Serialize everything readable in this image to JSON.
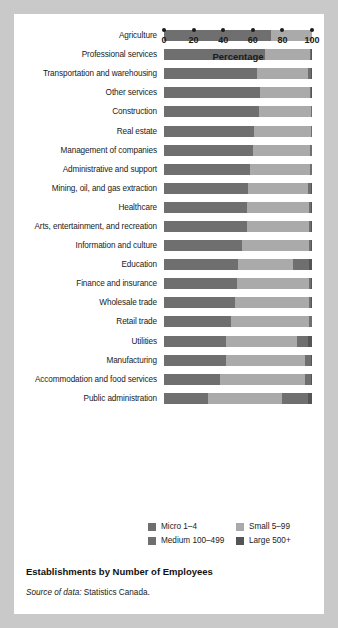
{
  "caption": {
    "title": "Establishments by Number of Employees",
    "source_label": "Source of data:",
    "source_value": "Statistics Canada."
  },
  "axis": {
    "title": "Percentage",
    "ticks": [
      "0",
      "20",
      "40",
      "60",
      "80",
      "100"
    ]
  },
  "legend": {
    "items": [
      {
        "label": "Micro 1–4",
        "color": "#6f6f6f"
      },
      {
        "label": "Small 5–99",
        "color": "#aaaaaa"
      },
      {
        "label": "Medium 100–499",
        "color": "#6f6f6f"
      },
      {
        "label": "Large 500+",
        "color": "#555555"
      }
    ]
  },
  "chart_data": {
    "type": "bar",
    "orientation": "horizontal",
    "stacked": true,
    "normalized": true,
    "title": "Establishments by Number of Employees",
    "xlabel": "Percentage",
    "ylabel": "",
    "xlim": [
      0,
      100
    ],
    "xticks": [
      0,
      20,
      40,
      60,
      80,
      100
    ],
    "grid": false,
    "legend_position": "bottom",
    "categories": [
      "Agriculture",
      "Professional services",
      "Transportation and warehousing",
      "Other services",
      "Construction",
      "Real estate",
      "Management of companies",
      "Administrative and support",
      "Mining, oil, and gas extraction",
      "Healthcare",
      "Arts, entertainment, and recreation",
      "Information and culture",
      "Education",
      "Finance and insurance",
      "Wholesale trade",
      "Retail trade",
      "Utilities",
      "Manufacturing",
      "Accommodation and food services",
      "Public administration"
    ],
    "series": [
      {
        "name": "Micro 1–4",
        "color": "#6f6f6f",
        "values": [
          72,
          68,
          63,
          65,
          64,
          61,
          60,
          58,
          57,
          56,
          56,
          53,
          50,
          49,
          48,
          45,
          42,
          42,
          38,
          30
        ]
      },
      {
        "name": "Small 5–99",
        "color": "#aaaaaa",
        "values": [
          28,
          30.5,
          34,
          33.5,
          35,
          38,
          38.5,
          40.5,
          40.5,
          42,
          42,
          45,
          37,
          49,
          50,
          53,
          48,
          53,
          57,
          50
        ]
      },
      {
        "name": "Medium 100–499",
        "color": "#6f6f6f",
        "values": [
          0,
          1,
          2,
          1,
          0.7,
          0.8,
          1.2,
          1.2,
          2,
          1.6,
          1.6,
          1.6,
          11,
          1.6,
          1.6,
          1.7,
          7,
          4,
          4.3,
          17
        ]
      },
      {
        "name": "Large 500+",
        "color": "#555555",
        "values": [
          0,
          0.5,
          1,
          0.5,
          0.3,
          0.2,
          0.3,
          0.3,
          0.5,
          0.4,
          0.4,
          0.4,
          2,
          0.4,
          0.4,
          0.3,
          3,
          1,
          0.7,
          3
        ]
      }
    ]
  }
}
